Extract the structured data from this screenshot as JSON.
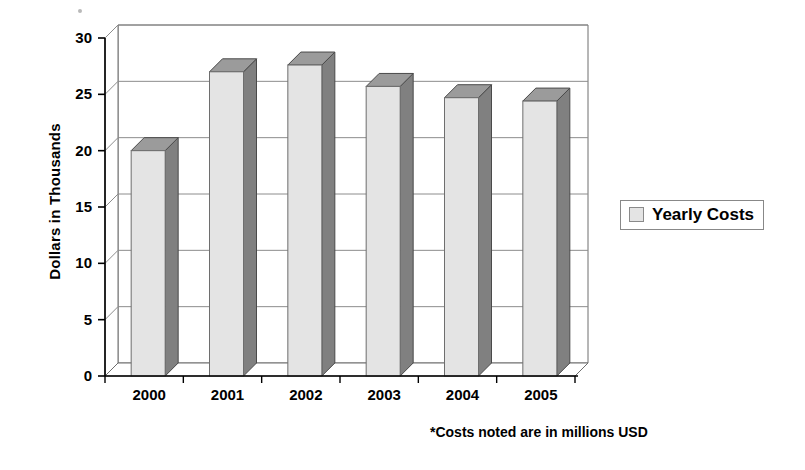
{
  "chart_data": {
    "type": "bar",
    "title": "",
    "subtitle": "",
    "xlabel": "",
    "ylabel": "Dollars in Thousands",
    "categories": [
      "2000",
      "2001",
      "2002",
      "2003",
      "2004",
      "2005"
    ],
    "series": [
      {
        "name": "Yearly Costs",
        "values": [
          20.0,
          27.0,
          27.6,
          25.7,
          24.7,
          24.4
        ],
        "color": "#e4e4e4"
      }
    ],
    "ylim": [
      0,
      30
    ],
    "yticks": [
      0,
      5,
      10,
      15,
      20,
      25,
      30
    ],
    "ytick_labels": [
      "0",
      "5",
      "10",
      "15",
      "20",
      "25",
      "30"
    ],
    "grid": true,
    "grid_axis": "y",
    "legend_position": "right",
    "style": "3d-column",
    "annotations": [
      "*Costs noted are in millions USD"
    ]
  },
  "legend": {
    "entries": [
      {
        "label": "Yearly Costs",
        "swatch_color": "#e4e4e4"
      }
    ]
  },
  "footnote": {
    "text": "*Costs noted are in millions USD"
  },
  "colors": {
    "bar_front": "#e4e4e4",
    "bar_side": "#808080",
    "bar_top": "#9b9b9b",
    "axis": "#000000",
    "gridline": "#8c8c8c",
    "background": "#ffffff"
  }
}
